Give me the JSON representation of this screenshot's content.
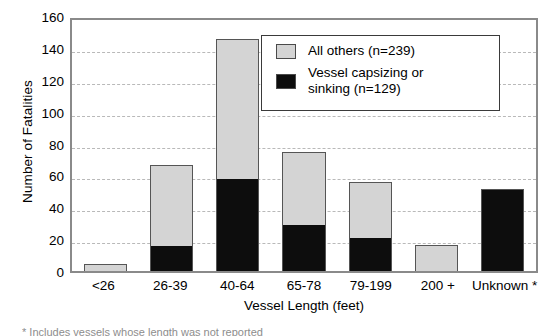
{
  "chart_data": {
    "type": "bar",
    "subtype": "stacked-vertical",
    "title": "",
    "xlabel": "Vessel Length (feet)",
    "ylabel": "Number of Fatalities",
    "categories": [
      "<26",
      "26-39",
      "40-64",
      "65-78",
      "79-199",
      "200 +",
      "Unknown *"
    ],
    "series": [
      {
        "name": "Vessel capsizing or sinking (n=129)",
        "color": "#0d0d0d",
        "values": [
          0,
          16,
          58,
          29,
          21,
          0,
          51
        ]
      },
      {
        "name": "All others (n=239)",
        "color": "#d4d4d4",
        "values": [
          4,
          50,
          87,
          45,
          34,
          16,
          0
        ]
      }
    ],
    "totals": [
      4,
      66,
      145,
      74,
      55,
      16,
      51
    ],
    "ylim": [
      0,
      160
    ],
    "yticks": [
      0,
      20,
      40,
      60,
      80,
      100,
      120,
      140,
      160
    ],
    "ytick_labels": [
      "0",
      "20",
      "40",
      "60",
      "80",
      "100",
      "120",
      "140",
      "160"
    ],
    "grid": "horizontal-dashed",
    "legend_position": "top-right"
  },
  "legend": {
    "entries": [
      {
        "label": "All others (n=239)",
        "swatch": "light-gray"
      },
      {
        "label": "Vessel capsizing or\nsinking (n=129)",
        "swatch": "black"
      }
    ]
  },
  "footnote": "* Includes vessels whose length was not reported",
  "colors": {
    "others": "#d4d4d4",
    "capsizing": "#0d0d0d",
    "axis": "#8a8a8a",
    "grid": "#b9b9b9"
  }
}
